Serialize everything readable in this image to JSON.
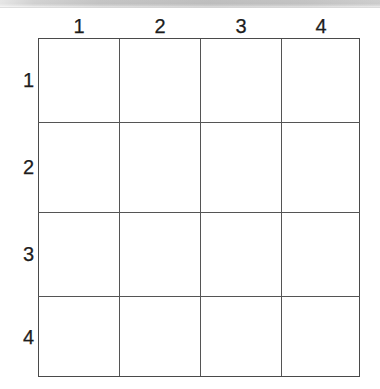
{
  "page": {
    "background_color": "#ffffff",
    "width": 380,
    "height": 389
  },
  "scan_band": {
    "name": "scanned-page-edge",
    "color": "#c6c6c6"
  },
  "grid": {
    "type": "empty-grid",
    "rows": 4,
    "columns": 4,
    "line_color": "#4a4a4a",
    "cell_fill": "#ffffff",
    "column_headers": [
      "1",
      "2",
      "3",
      "4"
    ],
    "row_headers": [
      "1",
      "2",
      "3",
      "4"
    ],
    "cells": [
      [
        "",
        "",
        "",
        ""
      ],
      [
        "",
        "",
        "",
        ""
      ],
      [
        "",
        "",
        "",
        ""
      ],
      [
        "",
        "",
        "",
        ""
      ]
    ],
    "column_x": [
      39,
      120,
      200,
      281,
      360
    ],
    "row_y": [
      38,
      122,
      212,
      296,
      377
    ]
  }
}
